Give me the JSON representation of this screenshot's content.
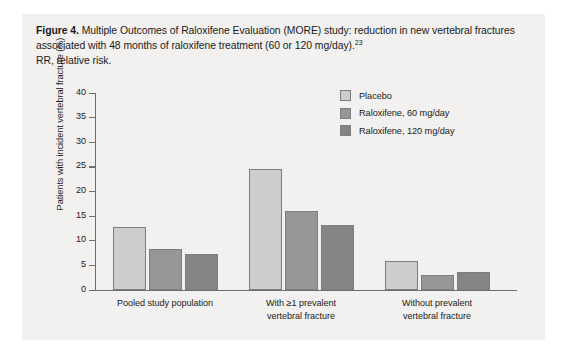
{
  "caption": {
    "figure_label": "Figure 4.",
    "text": " Multiple Outcomes of Raloxifene Evaluation (MORE) study: reduction in new vertebral fractures associated with 48 months of raloxifene treatment (60 or 120 mg/day).",
    "reference": "23",
    "abbreviation_note": "RR, relative risk."
  },
  "colors": {
    "panel_background": "#f2f1ef",
    "axis": "#6e6e6e",
    "bar_border": "#7d7d7d",
    "placebo": "#cdcdcd",
    "raloxifene_60": "#969696",
    "raloxifene_120": "#858585"
  },
  "chart_data": {
    "type": "bar",
    "title": "",
    "xlabel": "",
    "ylabel": "Patients with incident vertebral fracture (%)",
    "ylim": [
      0,
      40
    ],
    "yticks": [
      0,
      5,
      10,
      15,
      20,
      25,
      30,
      35,
      40
    ],
    "ytick_labels": [
      "0",
      "5",
      "10",
      "15",
      "20",
      "25",
      "30",
      "35",
      "40"
    ],
    "grid": false,
    "legend_position": "top-right",
    "categories": [
      "Pooled study population",
      "With ≥1 prevalent vertebral fracture",
      "Without prevalent vertebral fracture"
    ],
    "category_lines": [
      [
        "Pooled study population"
      ],
      [
        "With ≥1 prevalent",
        "vertebral fracture"
      ],
      [
        "Without prevalent",
        "vertebral fracture"
      ]
    ],
    "series": [
      {
        "name": "Placebo",
        "color": "#cdcdcd",
        "values": [
          12.8,
          24.5,
          5.9
        ]
      },
      {
        "name": "Raloxifene, 60 mg/day",
        "color": "#969696",
        "values": [
          8.3,
          16.0,
          3.0
        ]
      },
      {
        "name": "Raloxifene, 120 mg/day",
        "color": "#858585",
        "values": [
          7.3,
          13.2,
          3.6
        ]
      }
    ]
  }
}
